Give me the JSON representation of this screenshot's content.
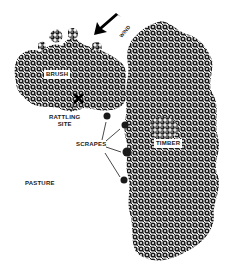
{
  "diagram": {
    "type": "hunting-setup-map",
    "colors": {
      "foliage": "#1a1a1a",
      "background": "#ffffff",
      "text": "#1a1a1a"
    },
    "labels": {
      "wind": "WIND",
      "brush": "BRUSH",
      "rattling_site_line1": "RATTLING",
      "rattling_site_line2": "SITE",
      "scrapes": "SCRAPES",
      "timber": "TIMBER",
      "pasture": "PASTURE"
    },
    "icons": {
      "wind_arrow": "arrow-down-left",
      "rattling_marker": "x-mark"
    },
    "regions": [
      "brush",
      "timber",
      "pasture"
    ],
    "scrape_count": 4
  }
}
